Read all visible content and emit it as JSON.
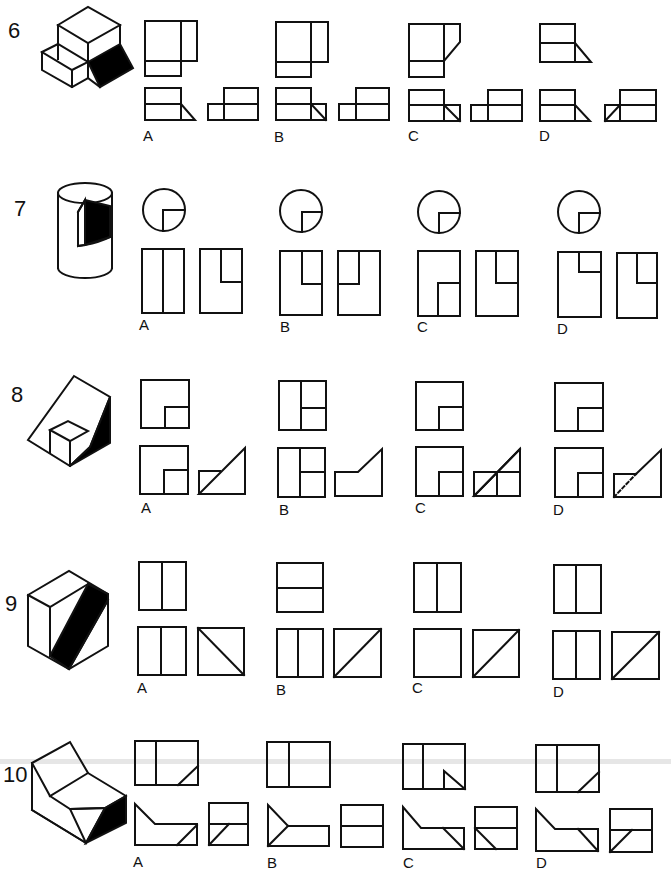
{
  "problems": [
    {
      "number": "6",
      "options": [
        "A",
        "B",
        "C",
        "D"
      ],
      "object": "stepped block with shaded wedge face"
    },
    {
      "number": "7",
      "options": [
        "A",
        "B",
        "C",
        "D"
      ],
      "object": "cylinder with quarter notch cut"
    },
    {
      "number": "8",
      "options": [
        "A",
        "B",
        "C",
        "D"
      ],
      "object": "sloped block with cube notch"
    },
    {
      "number": "9",
      "options": [
        "A",
        "B",
        "C",
        "D"
      ],
      "object": "cube with diagonal shaded face"
    },
    {
      "number": "10",
      "options": [
        "A",
        "B",
        "C",
        "D"
      ],
      "object": "angled V-block with shaded triangular face"
    }
  ],
  "colors": {
    "line": "#111111",
    "fill": "#000000",
    "background": "#ffffff"
  }
}
